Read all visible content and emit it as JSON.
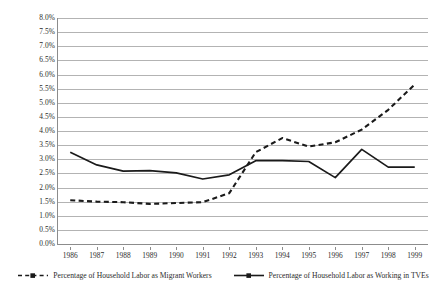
{
  "chart_data": {
    "type": "line",
    "title": "",
    "xlabel": "",
    "ylabel": "",
    "grid": true,
    "legend_position": "bottom",
    "x": [
      "1986",
      "1987",
      "1988",
      "1989",
      "1990",
      "1991",
      "1992",
      "1993",
      "1994",
      "1995",
      "1996",
      "1997",
      "1998",
      "1999"
    ],
    "categories": [
      "1986",
      "1987",
      "1988",
      "1989",
      "1990",
      "1991",
      "1992",
      "1993",
      "1994",
      "1995",
      "1996",
      "1997",
      "1998",
      "1999"
    ],
    "ylim": [
      0.0,
      8.0
    ],
    "ytick_step": 0.5,
    "ytick_labels": [
      "0.0%",
      "0.5%",
      "1.0%",
      "1.5%",
      "2.0%",
      "2.5%",
      "3.0%",
      "3.5%",
      "4.0%",
      "4.5%",
      "5.0%",
      "5.5%",
      "6.0%",
      "6.5%",
      "7.0%",
      "7.5%",
      "8.0%"
    ],
    "ytick_values": [
      0.0,
      0.5,
      1.0,
      1.5,
      2.0,
      2.5,
      3.0,
      3.5,
      4.0,
      4.5,
      5.0,
      5.5,
      6.0,
      6.5,
      7.0,
      7.5,
      8.0
    ],
    "series": [
      {
        "name": "Percentage of Household Labor as Migrant Workers",
        "style": "dashed",
        "color": "#1a1a1a",
        "values": [
          1.55,
          1.5,
          1.48,
          1.42,
          1.45,
          1.48,
          1.8,
          3.25,
          3.75,
          3.45,
          3.6,
          4.05,
          4.75,
          5.65
        ]
      },
      {
        "name": "Percentage of Household Labor as Working in TVEs",
        "style": "solid",
        "color": "#1a1a1a",
        "values": [
          3.25,
          2.8,
          2.58,
          2.6,
          2.52,
          2.3,
          2.45,
          2.95,
          2.95,
          2.92,
          2.35,
          3.35,
          2.72,
          2.72
        ]
      }
    ]
  },
  "legend": {
    "items": [
      {
        "label": "Percentage of Household Labor as Migrant Workers",
        "style": "dashed"
      },
      {
        "label": "Percentage of Household Labor as Working in TVEs",
        "style": "solid"
      }
    ]
  }
}
